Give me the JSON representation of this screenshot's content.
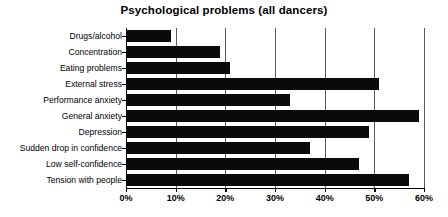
{
  "chart_data": {
    "type": "bar",
    "orientation": "horizontal",
    "title": "Psychological problems (all dancers)",
    "xlabel": "",
    "ylabel": "",
    "categories": [
      "Drugs/alcohol",
      "Concentration",
      "Eating problems",
      "External stress",
      "Performance anxiety",
      "General anxiety",
      "Depression",
      "Sudden drop in confidence",
      "Low self-confidence",
      "Tension with people"
    ],
    "values": [
      9,
      19,
      21,
      51,
      33,
      59,
      49,
      37,
      47,
      57
    ],
    "xlim": [
      0,
      60
    ],
    "xticks": [
      0,
      10,
      20,
      30,
      40,
      50,
      60
    ],
    "xtick_labels": [
      "0%",
      "10%",
      "20%",
      "30%",
      "40%",
      "50%",
      "60%"
    ],
    "grid": true,
    "grid_axis": "x",
    "legend": false,
    "bar_color": "#0a0a0a",
    "background_color": "#ffffff"
  }
}
